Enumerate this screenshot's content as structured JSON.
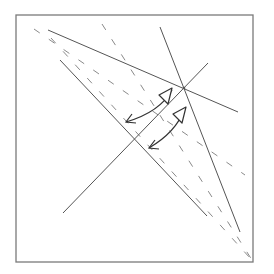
{
  "diagram": {
    "title": "",
    "frame": {
      "x": 16,
      "y": 15,
      "width": 237,
      "height": 247,
      "stroke": "#7a7a7a"
    },
    "colors": {
      "solid_line": "#555555",
      "dashed_line": "#8a8a8a",
      "arrow": "#333333",
      "background": "#ffffff"
    },
    "solid_lines": [
      {
        "id": "line-a",
        "x1": 60,
        "y1": 60,
        "x2": 207,
        "y2": 216
      },
      {
        "id": "line-b",
        "x1": 48,
        "y1": 30,
        "x2": 238,
        "y2": 112
      },
      {
        "id": "line-c",
        "x1": 160,
        "y1": 27,
        "x2": 240,
        "y2": 232
      },
      {
        "id": "line-d",
        "x1": 63,
        "y1": 213,
        "x2": 208,
        "y2": 63
      }
    ],
    "dashed_lines": [
      {
        "id": "dash-1",
        "x1": 34,
        "y1": 29,
        "x2": 245,
        "y2": 175
      },
      {
        "id": "dash-2",
        "x1": 51,
        "y1": 38,
        "x2": 250,
        "y2": 258
      },
      {
        "id": "dash-3",
        "x1": 102,
        "y1": 24,
        "x2": 252,
        "y2": 260
      }
    ],
    "intersection": {
      "x": 184,
      "y": 88
    },
    "double_arrows": [
      {
        "id": "arrow-upper",
        "path": "M 126 122 Q 160 112 172 90",
        "head_open_at": [
          172,
          88
        ],
        "head_line_at": [
          126,
          122
        ]
      },
      {
        "id": "arrow-lower",
        "path": "M 149 148 Q 176 132 184 110",
        "head_open_at": [
          186,
          107
        ],
        "head_line_at": [
          149,
          148
        ]
      }
    ]
  }
}
